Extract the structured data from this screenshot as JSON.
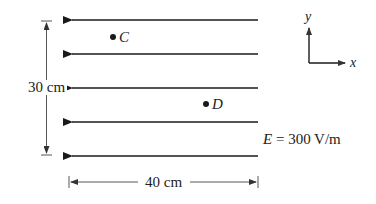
{
  "figure": {
    "field_lines": {
      "count": 5,
      "direction": "-x",
      "y_positions": [
        20,
        54,
        88,
        122,
        156
      ],
      "x_start": 258,
      "x_end": 70,
      "color": "#1a1a1a"
    },
    "points": [
      {
        "label": "C",
        "x": 113,
        "y": 37
      },
      {
        "label": "D",
        "x": 206,
        "y": 104
      }
    ],
    "vertical_dimension": {
      "label": "30 cm"
    },
    "horizontal_dimension": {
      "label": "40 cm"
    },
    "field_label": {
      "symbol": "E",
      "equals": " = ",
      "value": "300 V/m"
    },
    "axes": {
      "x_label": "x",
      "y_label": "y"
    }
  }
}
